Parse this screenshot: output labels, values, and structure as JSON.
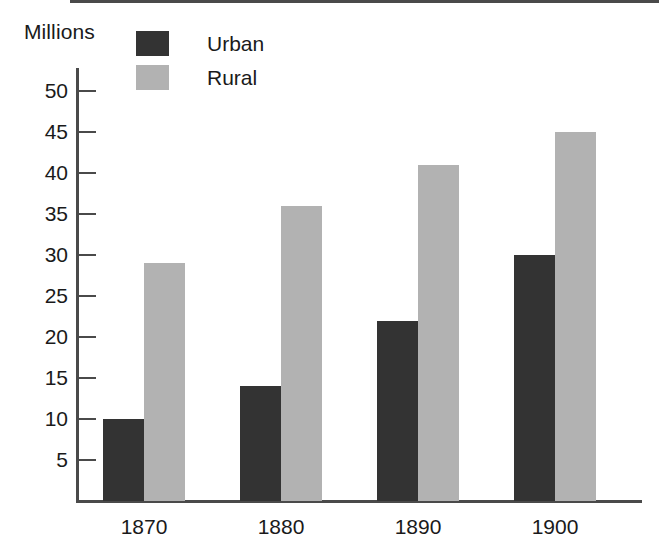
{
  "chart_data": {
    "type": "bar",
    "title": "",
    "xlabel": "",
    "ylabel": "Millions",
    "categories": [
      "1870",
      "1880",
      "1890",
      "1900"
    ],
    "series": [
      {
        "name": "Urban",
        "color": "#333333",
        "values": [
          10,
          14,
          22,
          30
        ]
      },
      {
        "name": "Rural",
        "color": "#b2b2b2",
        "values": [
          29,
          36,
          41,
          45
        ]
      }
    ],
    "ylim": [
      0,
      52
    ],
    "yticks": [
      5,
      10,
      15,
      20,
      25,
      30,
      35,
      40,
      45,
      50
    ],
    "ytick_labels": [
      "5",
      "10",
      "15",
      "20",
      "25",
      "30",
      "35",
      "40",
      "45",
      "50"
    ],
    "grid": false,
    "legend_position": "top-left-inside"
  },
  "axes": {
    "y_title": "Millions"
  },
  "legend": {
    "entries": [
      {
        "label": "Urban"
      },
      {
        "label": "Rural"
      }
    ]
  },
  "colors": {
    "urban": "#333333",
    "rural": "#b2b2b2",
    "axis": "#4a4a4a",
    "background": "#ffffff"
  }
}
